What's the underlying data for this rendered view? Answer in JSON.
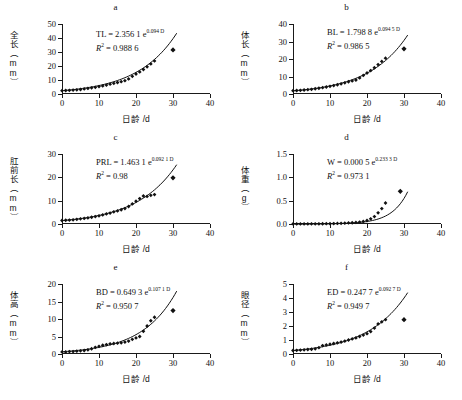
{
  "figure": {
    "x_axis_title": "日龄 /d",
    "x_ticks": [
      "0",
      "10",
      "20",
      "30",
      "40"
    ],
    "xlim": [
      0,
      40
    ]
  },
  "chart_data": [
    {
      "type": "scatter",
      "panel": "a",
      "title": "a",
      "ylabel": "全长（mm）",
      "y_unit": "mm",
      "y_name": "全长",
      "xlabel": "日龄 /d",
      "equation": "TL = 2.356 1 e",
      "equation_exponent": "0.094 D",
      "r2_label": "R",
      "r2_value": "= 0.988 6",
      "coef": 2.3561,
      "rate": 0.094,
      "r2": 0.9886,
      "ylim": [
        0,
        50
      ],
      "xlim": [
        0,
        40
      ],
      "y_ticks": [
        "0",
        "10",
        "20",
        "30",
        "40",
        "50"
      ],
      "x_ticks": [
        "0",
        "10",
        "20",
        "30",
        "40"
      ],
      "x": [
        0,
        1,
        2,
        3,
        4,
        5,
        6,
        7,
        8,
        9,
        10,
        11,
        12,
        13,
        14,
        15,
        16,
        17,
        18,
        19,
        20,
        21,
        22,
        23,
        24,
        25,
        30
      ],
      "y": [
        2.4,
        2.5,
        2.6,
        2.8,
        3.0,
        3.2,
        3.6,
        4.0,
        4.4,
        4.8,
        5.3,
        5.8,
        6.4,
        7.0,
        7.6,
        8.2,
        8.8,
        9.5,
        10.8,
        12.6,
        14.3,
        15.8,
        17.5,
        19.4,
        21.5,
        23.6,
        31.5
      ]
    },
    {
      "type": "scatter",
      "panel": "b",
      "title": "b",
      "ylabel": "体长（mm）",
      "y_unit": "mm",
      "y_name": "体长",
      "xlabel": "日龄 /d",
      "equation": "BL = 1.798 8 e",
      "equation_exponent": "0.094 5 D",
      "r2_label": "R",
      "r2_value": "= 0.986 5",
      "coef": 1.7988,
      "rate": 0.0945,
      "r2": 0.9865,
      "ylim": [
        0,
        40
      ],
      "xlim": [
        0,
        40
      ],
      "y_ticks": [
        "0",
        "10",
        "20",
        "30",
        "40"
      ],
      "x_ticks": [
        "0",
        "10",
        "20",
        "30",
        "40"
      ],
      "x": [
        0,
        1,
        2,
        3,
        4,
        5,
        6,
        7,
        8,
        9,
        10,
        11,
        12,
        13,
        14,
        15,
        16,
        17,
        18,
        19,
        20,
        21,
        22,
        23,
        24,
        25,
        30
      ],
      "y": [
        1.9,
        2.0,
        2.1,
        2.3,
        2.5,
        2.7,
        3.0,
        3.3,
        3.6,
        4.0,
        4.4,
        4.8,
        5.3,
        5.8,
        6.4,
        7.0,
        7.5,
        8.0,
        9.2,
        10.6,
        12.0,
        13.4,
        15.0,
        16.8,
        18.6,
        20.5,
        25.8
      ]
    },
    {
      "type": "scatter",
      "panel": "c",
      "title": "c",
      "ylabel": "肛前长（mm）",
      "y_unit": "mm",
      "y_name": "肛前长",
      "xlabel": "日龄 /d",
      "equation": "PRL = 1.463 1 e",
      "equation_exponent": "0.092 1 D",
      "r2_label": "R",
      "r2_value": "= 0.98",
      "coef": 1.4631,
      "rate": 0.0921,
      "r2": 0.98,
      "ylim": [
        0,
        30
      ],
      "xlim": [
        0,
        40
      ],
      "y_ticks": [
        "0",
        "10",
        "20",
        "30"
      ],
      "x_ticks": [
        "0",
        "10",
        "20",
        "30",
        "40"
      ],
      "x": [
        0,
        1,
        2,
        3,
        4,
        5,
        6,
        7,
        8,
        9,
        10,
        11,
        12,
        13,
        14,
        15,
        16,
        17,
        18,
        19,
        20,
        21,
        22,
        23,
        24,
        25,
        30
      ],
      "y": [
        1.5,
        1.6,
        1.7,
        1.8,
        2.0,
        2.2,
        2.4,
        2.6,
        2.9,
        3.2,
        3.5,
        3.9,
        4.3,
        4.7,
        5.2,
        5.6,
        6.1,
        6.6,
        7.5,
        8.6,
        9.8,
        10.9,
        12.0,
        11.8,
        12.3,
        12.6,
        19.8
      ]
    },
    {
      "type": "scatter",
      "panel": "d",
      "title": "d",
      "ylabel": "体重（g）",
      "y_unit": "g",
      "y_name": "体重",
      "xlabel": "日龄 /d",
      "equation": "W = 0.000 5 e",
      "equation_exponent": "0.233 3 D",
      "r2_label": "R",
      "r2_value": "= 0.973 1",
      "coef": 0.0005,
      "rate": 0.2333,
      "r2": 0.9731,
      "ylim": [
        0,
        1.5
      ],
      "xlim": [
        0,
        40
      ],
      "y_ticks": [
        "0.0",
        "0.5",
        "1.0",
        "1.5"
      ],
      "x_ticks": [
        "0",
        "10",
        "20",
        "30",
        "40"
      ],
      "x": [
        0,
        1,
        2,
        3,
        4,
        5,
        6,
        7,
        8,
        9,
        10,
        11,
        12,
        13,
        14,
        15,
        16,
        17,
        18,
        19,
        20,
        21,
        22,
        23,
        24,
        25,
        29
      ],
      "y": [
        0.001,
        0.001,
        0.001,
        0.002,
        0.002,
        0.003,
        0.003,
        0.004,
        0.005,
        0.006,
        0.008,
        0.01,
        0.012,
        0.015,
        0.018,
        0.022,
        0.027,
        0.033,
        0.042,
        0.055,
        0.075,
        0.11,
        0.16,
        0.24,
        0.33,
        0.45,
        0.7
      ]
    },
    {
      "type": "scatter",
      "panel": "e",
      "title": "e",
      "ylabel": "体高（mm）",
      "y_unit": "mm",
      "y_name": "体高",
      "xlabel": "日龄 /d",
      "equation": "BD = 0.649 3 e",
      "equation_exponent": "0.107 1 D",
      "r2_label": "R",
      "r2_value": "= 0.950 7",
      "coef": 0.6493,
      "rate": 0.1071,
      "r2": 0.9507,
      "ylim": [
        0,
        20
      ],
      "xlim": [
        0,
        40
      ],
      "y_ticks": [
        "0",
        "5",
        "10",
        "15",
        "20"
      ],
      "x_ticks": [
        "0",
        "10",
        "20",
        "30",
        "40"
      ],
      "x": [
        0,
        1,
        2,
        3,
        4,
        5,
        6,
        7,
        8,
        9,
        10,
        11,
        12,
        13,
        14,
        15,
        16,
        17,
        18,
        19,
        20,
        21,
        22,
        23,
        24,
        25,
        30
      ],
      "y": [
        0.6,
        0.6,
        0.7,
        0.7,
        0.8,
        0.9,
        1.0,
        1.2,
        1.5,
        1.9,
        2.2,
        2.5,
        2.7,
        2.9,
        3.0,
        3.1,
        3.2,
        3.4,
        3.7,
        4.2,
        4.6,
        5.0,
        6.5,
        8.0,
        9.5,
        10.5,
        12.4
      ]
    },
    {
      "type": "scatter",
      "panel": "f",
      "title": "f",
      "ylabel": "眼径（mm）",
      "y_unit": "mm",
      "y_name": "眼径",
      "xlabel": "日龄 /d",
      "equation": "ED = 0.247 7 e",
      "equation_exponent": "0.092 7 D",
      "r2_label": "R",
      "r2_value": "= 0.949 7",
      "coef": 0.2477,
      "rate": 0.0927,
      "r2": 0.9497,
      "ylim": [
        0,
        5
      ],
      "xlim": [
        0,
        40
      ],
      "y_ticks": [
        "0",
        "1",
        "2",
        "3",
        "4",
        "5"
      ],
      "x_ticks": [
        "0",
        "10",
        "20",
        "30",
        "40"
      ],
      "x": [
        0,
        1,
        2,
        3,
        4,
        5,
        6,
        7,
        8,
        9,
        10,
        11,
        12,
        13,
        14,
        15,
        16,
        17,
        18,
        19,
        20,
        21,
        22,
        23,
        24,
        25,
        30
      ],
      "y": [
        0.25,
        0.26,
        0.28,
        0.3,
        0.32,
        0.34,
        0.37,
        0.45,
        0.6,
        0.65,
        0.7,
        0.75,
        0.8,
        0.85,
        0.92,
        1.0,
        1.08,
        1.15,
        1.25,
        1.35,
        1.45,
        1.6,
        1.85,
        2.15,
        2.3,
        2.45,
        2.45
      ]
    }
  ]
}
